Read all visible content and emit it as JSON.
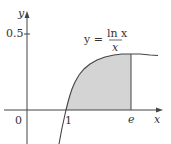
{
  "figure": {
    "y_axis_label": "y",
    "x_axis_label": "x",
    "origin_label": "0",
    "y_tick_label": "0.5",
    "x_tick_1_label": "1",
    "x_tick_e_label": "e",
    "equation": {
      "lhs": "y =",
      "numerator": "ln x",
      "denominator": "x"
    },
    "shaded_region": {
      "from": "1",
      "to": "e",
      "color": "#d4d4d4"
    }
  }
}
